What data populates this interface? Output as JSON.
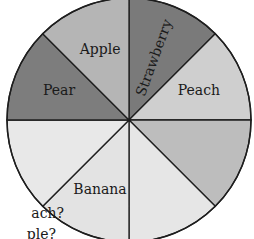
{
  "chart_data": {
    "type": "pie",
    "title": "",
    "center": [
      129,
      120
    ],
    "radius": 122,
    "start_angle_deg": 0,
    "direction": "clockwise",
    "slices": [
      {
        "label": "Strawberry",
        "value": 1,
        "color": "#7a7a7a",
        "label_rotate": -70
      },
      {
        "label": "Peach",
        "value": 1,
        "color": "#cfcfcf",
        "label_rotate": 0
      },
      {
        "label": "",
        "value": 1,
        "color": "#bdbdbd",
        "label_rotate": 0
      },
      {
        "label": "",
        "value": 1,
        "color": "#e6e6e6",
        "label_rotate": 0
      },
      {
        "label": "Banana",
        "value": 1,
        "color": "#e3e3e3",
        "label_rotate": 0
      },
      {
        "label": "",
        "value": 1,
        "color": "#e8e8e8",
        "label_rotate": 0
      },
      {
        "label": "Pear",
        "value": 1,
        "color": "#7d7d7d",
        "label_rotate": 0
      },
      {
        "label": "Apple",
        "value": 1,
        "color": "#b5b5b5",
        "label_rotate": 0
      }
    ],
    "labels_visible": [
      "Strawberry",
      "Peach",
      "Banana",
      "Pear",
      "Apple"
    ],
    "outline_color": "#1e1e1e",
    "legend": "none"
  },
  "question_fragments": {
    "line1": "ach?",
    "line2": "ple?"
  }
}
